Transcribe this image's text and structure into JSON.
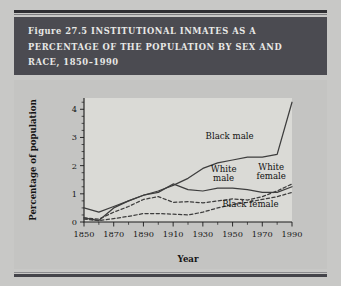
{
  "figure": {
    "number": "Figure 27.5",
    "title_lines": [
      "Figure 27.5  INSTITUTIONAL INMATES AS A",
      "PERCENTAGE OF THE POPULATION BY SEX AND",
      "RACE, 1850–1990"
    ],
    "banner_color": "#4b4b51",
    "banner_text_color": "#e8e8e6",
    "plate_color": "#c4c4c2",
    "plot_background": "#dadad6"
  },
  "chart_data": {
    "type": "line",
    "title": "Institutional Inmates as a Percentage of the Population by Sex and Race, 1850–1990",
    "xlabel": "Year",
    "ylabel": "Percentage of population",
    "xlim": [
      1850,
      1990
    ],
    "ylim": [
      0,
      4.4
    ],
    "yticks": [
      0,
      1,
      2,
      3,
      4
    ],
    "ytick_labels": [
      "0",
      "1",
      "2",
      "3",
      "4"
    ],
    "xticks": [
      1850,
      1870,
      1890,
      1910,
      1930,
      1950,
      1970,
      1990
    ],
    "xtick_labels": [
      "1850",
      "1870",
      "1890",
      "1910",
      "1930",
      "1950",
      "1970",
      "1990"
    ],
    "x_minor_step": 10,
    "y_minor_step": 0.25,
    "grid": false,
    "legend": "inline-annotations",
    "x": [
      1850,
      1860,
      1870,
      1880,
      1890,
      1900,
      1910,
      1920,
      1930,
      1940,
      1950,
      1960,
      1970,
      1980,
      1990
    ],
    "series": [
      {
        "name": "Black male",
        "style": "solid",
        "color": "#3d3d3d",
        "values": [
          0.15,
          0.05,
          0.5,
          0.75,
          0.95,
          1.1,
          1.3,
          1.55,
          1.9,
          2.1,
          2.2,
          2.3,
          2.3,
          2.4,
          4.25
        ],
        "label_x": 1948,
        "label_y": 2.95
      },
      {
        "name": "White male",
        "style": "solid",
        "color": "#3d3d3d",
        "values": [
          0.5,
          0.35,
          0.55,
          0.75,
          0.95,
          1.05,
          1.35,
          1.15,
          1.1,
          1.2,
          1.2,
          1.15,
          1.05,
          1.05,
          1.25
        ],
        "label_x": 1944,
        "label_y": 1.78
      },
      {
        "name": "White female",
        "style": "dashed",
        "color": "#3d3d3d",
        "values": [
          0.15,
          0.1,
          0.35,
          0.55,
          0.8,
          0.9,
          0.7,
          0.72,
          0.68,
          0.75,
          0.82,
          0.78,
          0.9,
          1.1,
          1.35
        ],
        "label_x": 1976,
        "label_y": 1.85
      },
      {
        "name": "Black female",
        "style": "dashed",
        "color": "#3d3d3d",
        "values": [
          0.1,
          0.05,
          0.12,
          0.2,
          0.3,
          0.3,
          0.28,
          0.25,
          0.35,
          0.5,
          0.62,
          0.7,
          0.8,
          0.9,
          1.05
        ],
        "label_x": 1962,
        "label_y": 0.52
      }
    ]
  }
}
